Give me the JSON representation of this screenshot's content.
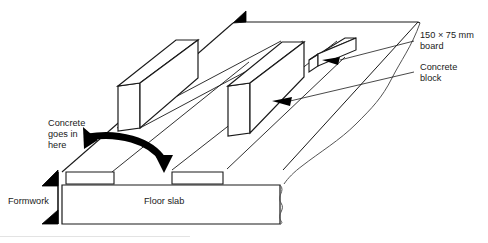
{
  "figure": {
    "type": "isometric-construction-diagram",
    "background_color": "#ffffff",
    "line_color": "#1a1a1a",
    "fill_color": "#ffffff",
    "arrow_color": "#000000",
    "break_line_color": "#555555"
  },
  "labels": {
    "board": {
      "line1": "150 × 75 mm",
      "line2": "board"
    },
    "block": {
      "line1": "Concrete",
      "line2": "block"
    },
    "pour": {
      "line1": "Concrete",
      "line2": "goes in",
      "line3": "here"
    },
    "formwork": "Formwork",
    "floor_slab": "Floor slab"
  },
  "elements": {
    "boards_count": 3,
    "blocks_count": 2,
    "leader_arrows_count": 2,
    "pour_arrow": "curved-thick-arrow-down",
    "break_lines": 2
  }
}
